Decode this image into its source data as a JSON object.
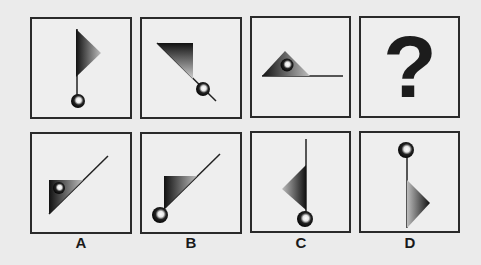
{
  "puzzle": {
    "question_row": [
      {
        "id": "q1",
        "figure": "flag-up-ball-bottom"
      },
      {
        "id": "q2",
        "figure": "flag-diagonal-ball-lower-right"
      },
      {
        "id": "q3",
        "figure": "flag-horizontal-ball-inside"
      },
      {
        "id": "q4",
        "figure": "question-mark",
        "symbol": "?"
      }
    ],
    "options": [
      {
        "label": "A",
        "figure": "flag-diagonal-ball-inside"
      },
      {
        "label": "B",
        "figure": "flag-diagonal-ball-bottom-left"
      },
      {
        "label": "C",
        "figure": "flag-down-left-ball-bottom"
      },
      {
        "label": "D",
        "figure": "flag-down-right-ball-top"
      }
    ]
  },
  "colors": {
    "background": "#ebebeb",
    "border": "#2a2a2a",
    "shape_dark": "#111111",
    "shape_light": "#c8c8c8"
  }
}
